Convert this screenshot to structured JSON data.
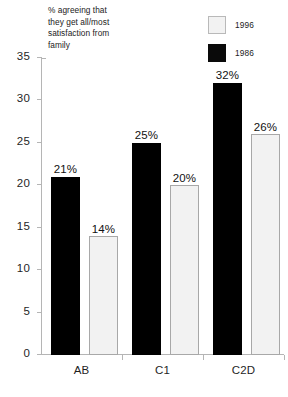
{
  "chart_data": {
    "type": "bar",
    "title": "% agreeing that\nthey get all/most\nsatisfaction from\nfamily",
    "xlabel": "",
    "ylabel": "",
    "ylim": [
      0,
      35
    ],
    "yticks": [
      0,
      5,
      10,
      15,
      20,
      25,
      30,
      35
    ],
    "ytick_labels": [
      "0",
      "5",
      "10",
      "15",
      "20",
      "25",
      "30",
      "35"
    ],
    "grid": false,
    "legend_position": "top-right",
    "categories": [
      "AB",
      "C1",
      "C2D"
    ],
    "series": [
      {
        "name": "1986",
        "color": "#000000",
        "values": [
          21,
          25,
          32
        ],
        "labels": [
          "21%",
          "25%",
          "32%"
        ]
      },
      {
        "name": "1996",
        "color": "#f2f2f2",
        "values": [
          14,
          20,
          26
        ],
        "labels": [
          "14%",
          "20%",
          "26%"
        ]
      }
    ]
  },
  "legend": {
    "entries": [
      {
        "label": "1996",
        "swatch": "light"
      },
      {
        "label": "1986",
        "swatch": "dark"
      }
    ]
  }
}
